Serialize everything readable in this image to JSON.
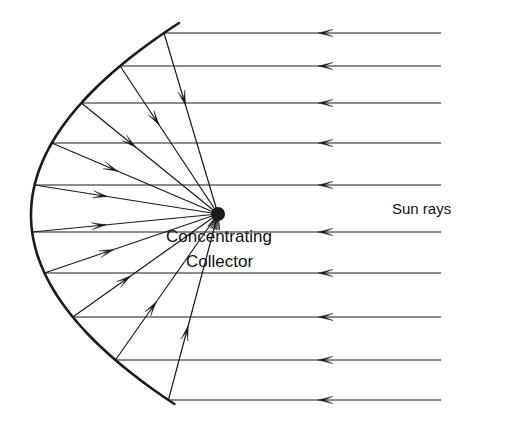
{
  "figure": {
    "background_color": "#ffffff",
    "stroke_color": "#1a1a1a",
    "width": 506,
    "height": 423
  },
  "labels": {
    "collector_line1": "Concentrating",
    "collector_line2": "Collector",
    "sun_rays": "Sun rays"
  },
  "icons": {
    "focus": "focal-point-blob-icon",
    "mirror": "parabolic-mirror-icon",
    "incoming_arrow": "left-arrow-icon",
    "reflected_arrow": "arrow-toward-focus-icon"
  },
  "chart_data": {
    "type": "diagram",
    "focus": {
      "x": 218,
      "y": 214,
      "radius": 7
    },
    "mirror": {
      "type": "parabola",
      "vertex": {
        "x": 31,
        "y": 215
      },
      "top_end": {
        "x": 179,
        "y": 23
      },
      "bottom_end": {
        "x": 166,
        "y": 404
      },
      "stroke_width": 2.6
    },
    "rays": [
      {
        "id": 1,
        "y": 33,
        "hit_x": 147,
        "incoming_start_x": 441,
        "arrow_tip_x": 318
      },
      {
        "id": 2,
        "y": 66,
        "hit_x": 106,
        "incoming_start_x": 441,
        "arrow_tip_x": 318
      },
      {
        "id": 3,
        "y": 103,
        "hit_x": 74,
        "incoming_start_x": 441,
        "arrow_tip_x": 318
      },
      {
        "id": 4,
        "y": 143,
        "hit_x": 46,
        "incoming_start_x": 441,
        "arrow_tip_x": 318
      },
      {
        "id": 5,
        "y": 185,
        "hit_x": 33,
        "incoming_start_x": 441,
        "arrow_tip_x": 318
      },
      {
        "id": 6,
        "y": 232,
        "hit_x": 33,
        "incoming_start_x": 441,
        "arrow_tip_x": 318
      },
      {
        "id": 7,
        "y": 273,
        "hit_x": 45,
        "incoming_start_x": 441,
        "arrow_tip_x": 318
      },
      {
        "id": 8,
        "y": 317,
        "hit_x": 73,
        "incoming_start_x": 441,
        "arrow_tip_x": 318
      },
      {
        "id": 9,
        "y": 360,
        "hit_x": 106,
        "incoming_start_x": 441,
        "arrow_tip_x": 318
      },
      {
        "id": 10,
        "y": 400,
        "hit_x": 152,
        "incoming_start_x": 441,
        "arrow_tip_x": 318
      }
    ]
  }
}
